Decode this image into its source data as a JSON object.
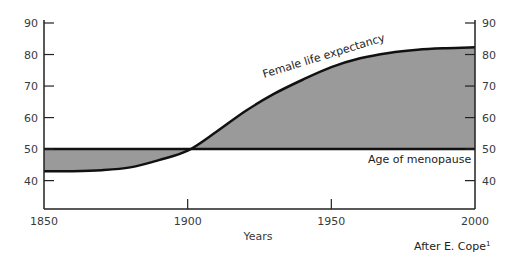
{
  "chart_data": {
    "type": "area",
    "title": "",
    "xlabel": "Years",
    "ylabel": "",
    "xlim": [
      1850,
      2000
    ],
    "ylim": [
      31,
      90
    ],
    "x_ticks": [
      1850,
      1900,
      1950,
      2000
    ],
    "y_ticks": [
      40,
      50,
      60,
      70,
      80,
      90
    ],
    "grid": false,
    "series": [
      {
        "name": "Female life expectancy",
        "x": [
          1850,
          1860,
          1870,
          1880,
          1890,
          1900,
          1910,
          1920,
          1930,
          1940,
          1950,
          1960,
          1970,
          1980,
          1990,
          2000
        ],
        "values": [
          43,
          43,
          43.3,
          44.2,
          46.5,
          49.5,
          55.5,
          62,
          67.5,
          72,
          76,
          78.8,
          80.5,
          81.5,
          82,
          82.3
        ]
      },
      {
        "name": "Age of menopause",
        "x": [
          1850,
          2000
        ],
        "values": [
          50,
          50
        ]
      }
    ],
    "annotations": [
      {
        "text": "Female life expectancy",
        "near": "upper curve"
      },
      {
        "text": "Age of menopause",
        "near": "menopause line"
      }
    ],
    "source": "After E. Cope",
    "source_superscript": "1",
    "fill_color": "#9a9a9a",
    "line_color": "#111111"
  }
}
